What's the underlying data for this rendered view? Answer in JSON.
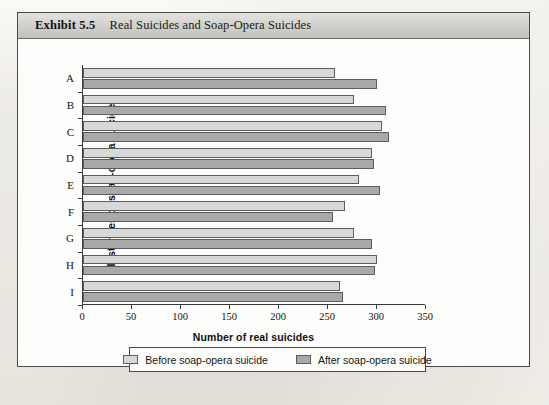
{
  "exhibit": {
    "number": "Exhibit 5.5",
    "title": "Real Suicides and Soap-Opera Suicides"
  },
  "chart_data": {
    "type": "bar",
    "orientation": "horizontal",
    "title": "Real Suicides and Soap-Opera Suicides",
    "categories": [
      "A",
      "B",
      "C",
      "D",
      "E",
      "F",
      "G",
      "H",
      "I"
    ],
    "series": [
      {
        "name": "Before soap-opera suicide",
        "color": "#d8d8d8",
        "values": [
          257,
          277,
          305,
          295,
          282,
          267,
          277,
          300,
          262
        ]
      },
      {
        "name": "After soap-opera suicide",
        "color": "#a9a9a9",
        "values": [
          300,
          309,
          312,
          297,
          303,
          255,
          295,
          298,
          265
        ]
      }
    ],
    "xlabel": "Number of real suicides",
    "ylabel": "Instances of soap-opera suicide",
    "xlim": [
      0,
      350
    ],
    "xticks": [
      0,
      50,
      100,
      150,
      200,
      250,
      300,
      350
    ],
    "xtick_labels": [
      "0",
      "50",
      "100",
      "150",
      "200",
      "250",
      "300",
      "350"
    ],
    "grid": false,
    "legend_position": "bottom"
  }
}
